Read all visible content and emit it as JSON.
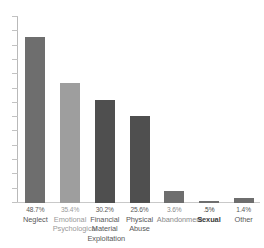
{
  "chart_data": {
    "type": "bar",
    "title": "",
    "subtitle": "",
    "xlabel": "",
    "ylabel": "",
    "ylim": [
      0,
      55
    ],
    "grid": false,
    "legend": "none",
    "y_axis_tick_labels_shown": false,
    "y_axis_tick_count": 14,
    "categories": [
      "Neglect",
      "Emotional Psychological",
      "Financial Material Exploitation",
      "Physical Abuse",
      "Abandonment",
      "Sexual",
      "Other"
    ],
    "category_lines": [
      [
        "Neglect"
      ],
      [
        "Emotional",
        "Psychological"
      ],
      [
        "Financial",
        "Material",
        "Exploitation"
      ],
      [
        "Physical",
        "Abuse"
      ],
      [
        "Abandonment"
      ],
      [
        "Sexual"
      ],
      [
        "Other"
      ]
    ],
    "values": [
      48.7,
      35.4,
      30.2,
      25.6,
      3.6,
      0.5,
      1.4
    ],
    "value_labels": [
      "48.7%",
      "35.4%",
      "30.2%",
      "25.6%",
      "3.6%",
      ".5%",
      "1.4%"
    ],
    "bar_colors": [
      "#6e6e6e",
      "#9e9e9e",
      "#4f4f4f",
      "#4f4f4f",
      "#6e6e6e",
      "#6e6e6e",
      "#6e6e6e"
    ],
    "label_colors": [
      "#585858",
      "#9a9a9a",
      "#585858",
      "#585858",
      "#8a8a8a",
      "#3c3c3c",
      "#585858"
    ],
    "label_bold": [
      false,
      false,
      false,
      false,
      false,
      true,
      false
    ]
  },
  "colors": {
    "background": "#ffffff",
    "axis": "#bdbdbd",
    "baseline": "#c9c9c9",
    "tick": "#c2c2c2",
    "bar_dark": "#4f4f4f",
    "bar_mid": "#6e6e6e",
    "bar_light": "#9e9e9e",
    "text": "#585858"
  }
}
